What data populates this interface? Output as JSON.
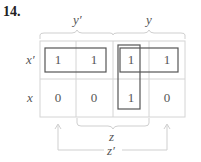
{
  "problem_number": "14.",
  "kmap": {
    "column_groups": [
      {
        "label": "y'",
        "span": "columns 1-2"
      },
      {
        "label": "y",
        "span": "columns 3-4"
      }
    ],
    "bottom_groups": [
      {
        "label": "z",
        "span": "columns 2-3"
      },
      {
        "label": "z'",
        "span": "columns 1 and 4"
      }
    ],
    "rows": [
      {
        "label": "x'",
        "cells": [
          "1",
          "1",
          "1",
          "1"
        ]
      },
      {
        "label": "x",
        "cells": [
          "0",
          "0",
          "1",
          "0"
        ]
      }
    ],
    "groupings": [
      {
        "name": "x'y' group",
        "cells": "row 1, columns 1-2"
      },
      {
        "name": "x'y group",
        "cells": "row 1, columns 3-4"
      },
      {
        "name": "yz group",
        "cells": "column 3, rows 1-2"
      }
    ]
  },
  "colors": {
    "grid_line": "#d4d4d4",
    "group_box": "#555555",
    "text": "#555555"
  }
}
